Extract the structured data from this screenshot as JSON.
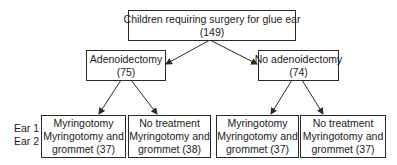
{
  "diagram": {
    "type": "flowchart",
    "root": {
      "title": "Children requiring surgery for glue ear",
      "count": "(149)"
    },
    "branches": [
      {
        "title": "Adenoidectomy",
        "count": "(75)",
        "children": [
          {
            "line1": "Myringotomy",
            "line2": "Myringotomy and",
            "line3": "grommet (37)"
          },
          {
            "line1": "No treatment",
            "line2": "Myringotomy and",
            "line3": "grommet (38)"
          }
        ]
      },
      {
        "title": "No adenoidectomy",
        "count": "(74)",
        "children": [
          {
            "line1": "Myringotomy",
            "line2": "Myringotomy and",
            "line3": "grommet (37)"
          },
          {
            "line1": "No treatment",
            "line2": "Myringotomy and",
            "line3": "grommet (37)"
          }
        ]
      }
    ],
    "row_labels": {
      "ear1": "Ear 1",
      "ear2": "Ear 2"
    },
    "colors": {
      "line": "#2a2a2a",
      "background": "#ffffff",
      "text": "#1a1a1a"
    }
  }
}
